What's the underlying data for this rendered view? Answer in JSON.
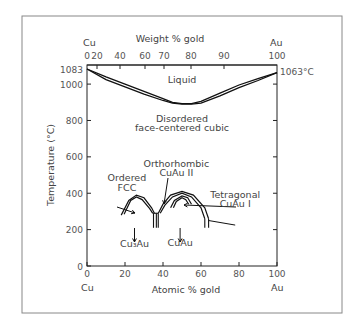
{
  "chart_data": {
    "type": "phase-diagram",
    "title": "",
    "xlabel": "Atomic % gold",
    "x2label": "Weight % gold",
    "ylabel": "Temperature (°C)",
    "xlim": [
      0,
      100
    ],
    "ylim": [
      0,
      1083
    ],
    "x_ticks": [
      0,
      20,
      40,
      60,
      80,
      100
    ],
    "x_tick_labels": [
      "0",
      "20",
      "40",
      "60",
      "80",
      "100"
    ],
    "x2_ticks_atomic": [
      0,
      2.5,
      7,
      14,
      20,
      33.5,
      52,
      100
    ],
    "x2_tick_labels": [
      "0",
      "20",
      "40",
      "60",
      "70",
      "80",
      "90",
      "100"
    ],
    "y_ticks": [
      0,
      200,
      400,
      600,
      800,
      1000,
      1083
    ],
    "y_tick_labels": [
      "0",
      "200",
      "400",
      "600",
      "800",
      "1000",
      "1083"
    ],
    "x_end_labels": {
      "left": "Cu",
      "right": "Au"
    },
    "x2_end_labels": {
      "left": "Cu",
      "right": "Au"
    },
    "melting_point_label": "1063°C",
    "liquidus": [
      [
        0,
        1083
      ],
      [
        10,
        1040
      ],
      [
        20,
        1000
      ],
      [
        30,
        960
      ],
      [
        40,
        920
      ],
      [
        45,
        900
      ],
      [
        50,
        893
      ],
      [
        55,
        893
      ],
      [
        60,
        905
      ],
      [
        70,
        950
      ],
      [
        80,
        995
      ],
      [
        90,
        1030
      ],
      [
        100,
        1063
      ]
    ],
    "solidus": [
      [
        0,
        1083
      ],
      [
        10,
        1025
      ],
      [
        20,
        985
      ],
      [
        30,
        945
      ],
      [
        40,
        910
      ],
      [
        45,
        895
      ],
      [
        50,
        890
      ],
      [
        55,
        890
      ],
      [
        60,
        895
      ],
      [
        70,
        935
      ],
      [
        80,
        980
      ],
      [
        90,
        1020
      ],
      [
        100,
        1063
      ]
    ],
    "regions": [
      {
        "label": "Liquid",
        "at": [
          50,
          1005
        ]
      },
      {
        "label": "Disordered",
        "at": [
          50,
          790
        ]
      },
      {
        "label": "face-centered cubic",
        "at": [
          50,
          740
        ]
      },
      {
        "label": "Ordered",
        "at": [
          21,
          470
        ]
      },
      {
        "label": "FCC",
        "at": [
          21,
          415
        ]
      },
      {
        "label": "Orthorhombic",
        "at": [
          47,
          545
        ]
      },
      {
        "label": "CuAu II",
        "at": [
          47,
          495
        ]
      },
      {
        "label": "Tetragonal",
        "at": [
          78,
          375
        ]
      },
      {
        "label": "CuAu I",
        "at": [
          78,
          325
        ]
      },
      {
        "label": "Cu₃Au",
        "at": [
          25,
          105
        ]
      },
      {
        "label": "CuAu",
        "at": [
          49,
          110
        ]
      }
    ],
    "ordered_domes": [
      {
        "name": "Cu3Au",
        "outer": [
          [
            18,
            280
          ],
          [
            22,
            360
          ],
          [
            26,
            390
          ],
          [
            30,
            375
          ],
          [
            34,
            320
          ],
          [
            35.5,
            290
          ]
        ],
        "inner": [
          [
            19.5,
            285
          ],
          [
            23,
            360
          ],
          [
            26,
            380
          ],
          [
            29,
            365
          ],
          [
            33,
            315
          ],
          [
            34.5,
            290
          ]
        ]
      },
      {
        "name": "CuAu II",
        "outer": [
          [
            37.5,
            290
          ],
          [
            40,
            340
          ],
          [
            44,
            390
          ],
          [
            50,
            410
          ],
          [
            56,
            390
          ],
          [
            62,
            320
          ],
          [
            64,
            260
          ]
        ],
        "inner": [
          [
            38.5,
            290
          ],
          [
            41,
            335
          ],
          [
            45,
            380
          ],
          [
            50,
            400
          ],
          [
            55,
            380
          ],
          [
            60,
            320
          ],
          [
            62,
            260
          ]
        ]
      },
      {
        "name": "CuAu I",
        "outer": [
          [
            44,
            320
          ],
          [
            46,
            360
          ],
          [
            50,
            385
          ],
          [
            53,
            375
          ],
          [
            55,
            340
          ]
        ],
        "inner": [
          [
            45.5,
            320
          ],
          [
            47,
            355
          ],
          [
            50,
            375
          ],
          [
            52,
            365
          ],
          [
            53.5,
            340
          ]
        ]
      }
    ],
    "grid": false,
    "legend": "none"
  }
}
